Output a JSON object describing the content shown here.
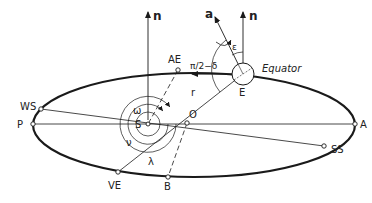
{
  "diagram": {
    "colors": {
      "stroke": "#1a1a1a",
      "background": "#ffffff"
    },
    "labels": {
      "n_sun": "n",
      "n_earth": "n",
      "axis": "a",
      "autumn_equinox": "AE",
      "vernal_equinox": "VE",
      "winter_solstice": "WS",
      "summer_solstice": "SS",
      "perihelion": "P",
      "aphelion": "A",
      "sun": "S",
      "earth": "E",
      "origin": "O",
      "point_b": "B",
      "radius": "r",
      "obliquity": "ε",
      "declination": "π/2−δ",
      "equator": "Equator",
      "omega": "ω",
      "nu": "ν",
      "lambda": "λ"
    }
  }
}
